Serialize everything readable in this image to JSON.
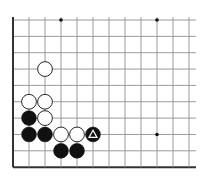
{
  "board": {
    "description": "Go problem diagram (lower-left corner region)",
    "origin_x": 13,
    "origin_y": 20,
    "spacing_x": 16,
    "spacing_y": 16.35,
    "cols": 12,
    "rows": 10,
    "line_extend_right": 196,
    "left_edge": true,
    "bottom_edge": true,
    "line_color": "#9a9a9a",
    "edge_color": "#333333",
    "star_points": [
      [
        3,
        0
      ],
      [
        9,
        0
      ],
      [
        9,
        7
      ]
    ],
    "stones": [
      {
        "color": "white",
        "col": 2,
        "row": 3
      },
      {
        "color": "white",
        "col": 1,
        "row": 5
      },
      {
        "color": "white",
        "col": 2,
        "row": 5
      },
      {
        "color": "black",
        "col": 1,
        "row": 6
      },
      {
        "color": "white",
        "col": 2,
        "row": 6
      },
      {
        "color": "black",
        "col": 1,
        "row": 7
      },
      {
        "color": "black",
        "col": 2,
        "row": 7
      },
      {
        "color": "white",
        "col": 3,
        "row": 7
      },
      {
        "color": "white",
        "col": 4,
        "row": 7
      },
      {
        "color": "black",
        "col": 5,
        "row": 7,
        "marker": "triangle"
      },
      {
        "color": "black",
        "col": 3,
        "row": 8
      },
      {
        "color": "black",
        "col": 4,
        "row": 8
      }
    ]
  }
}
